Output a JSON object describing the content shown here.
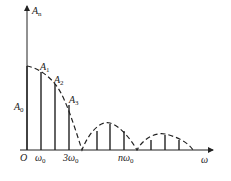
{
  "axes": {
    "y_label": "A",
    "y_label_sub": "n",
    "x_label": "ω",
    "origin": "O"
  },
  "labels": {
    "a0": {
      "main": "A",
      "sub": "0"
    },
    "a1": {
      "main": "A",
      "sub": "1"
    },
    "a2": {
      "main": "A",
      "sub": "2"
    },
    "a3": {
      "main": "A",
      "sub": "3"
    }
  },
  "ticks": {
    "w0": {
      "main": "ω",
      "sub": "0"
    },
    "w3": {
      "main": "3ω",
      "sub": "0"
    },
    "nw": {
      "main": "nω",
      "sub": "0"
    }
  },
  "colors": {
    "stroke": "#222222"
  },
  "spectral_lines": [
    {
      "x": 41,
      "top": 72
    },
    {
      "x": 55,
      "top": 84
    },
    {
      "x": 69,
      "top": 105
    },
    {
      "x": 97,
      "top": 131
    },
    {
      "x": 110,
      "top": 124
    },
    {
      "x": 124,
      "top": 131
    },
    {
      "x": 151,
      "top": 140
    },
    {
      "x": 165,
      "top": 135
    },
    {
      "x": 179,
      "top": 140
    }
  ]
}
